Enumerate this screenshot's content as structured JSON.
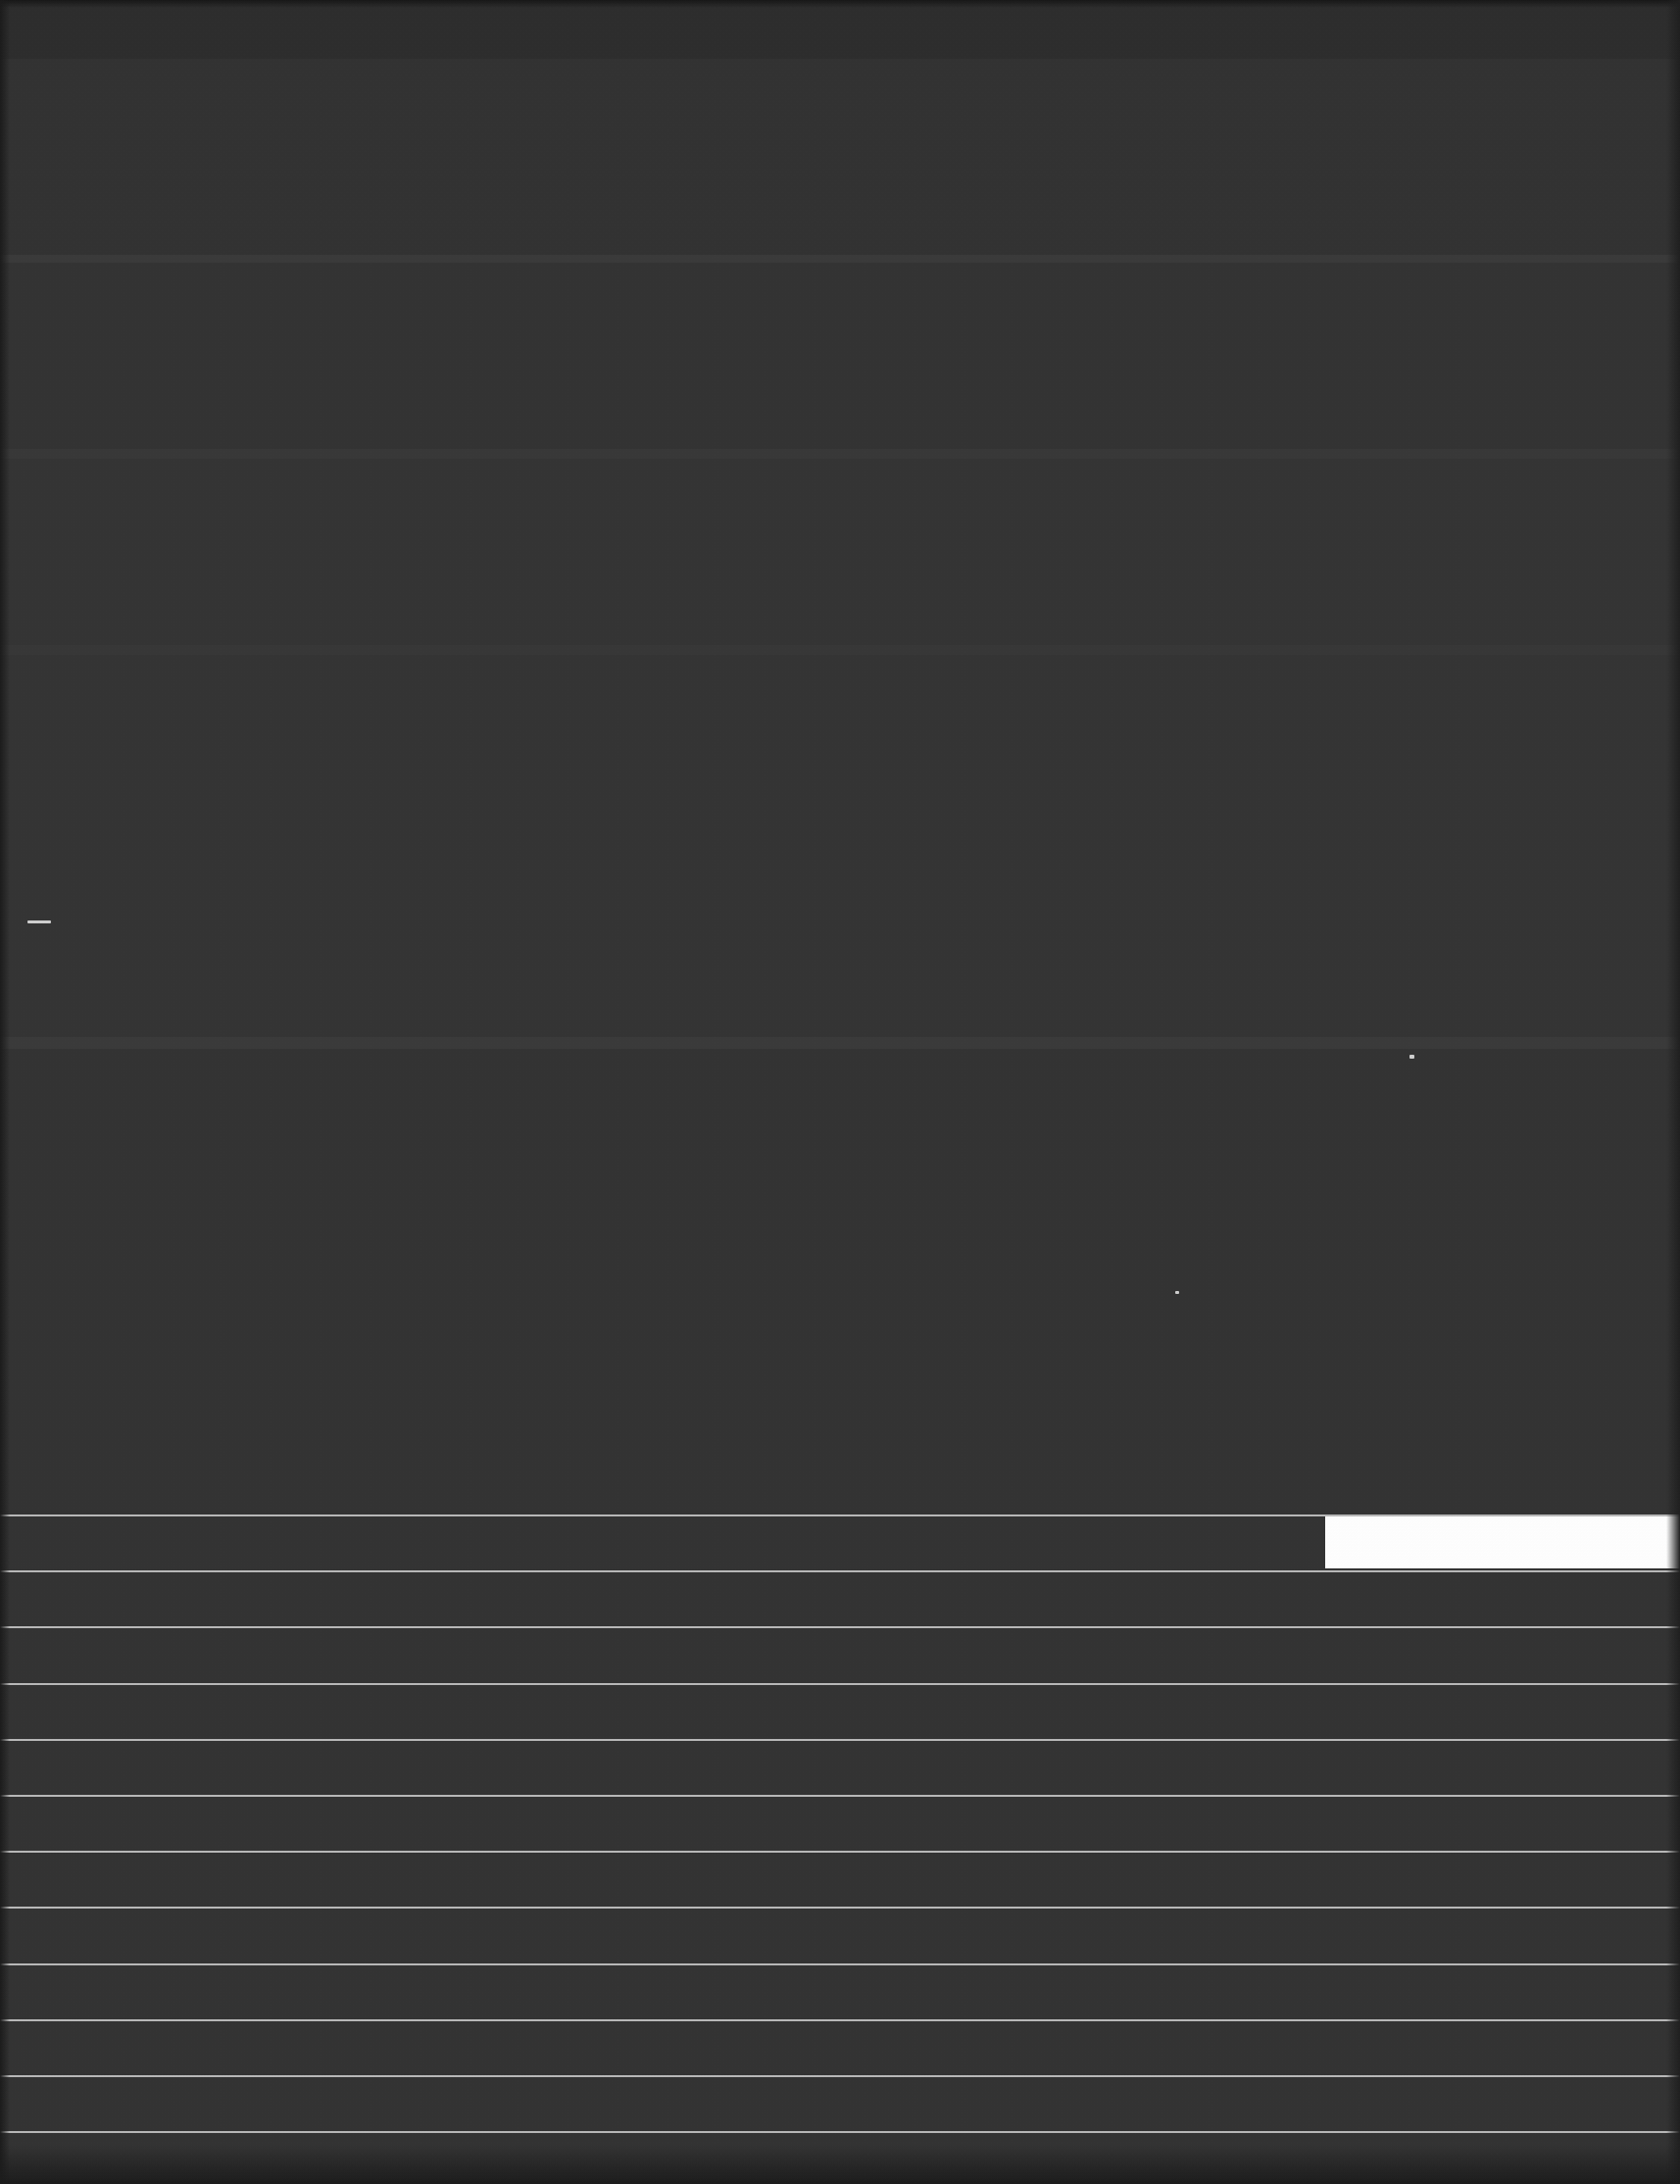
{
  "screen": {
    "width": 1714,
    "height": 2228,
    "background_color": "#333333",
    "appearance": "dark",
    "state_label": "blank-dark-capture"
  },
  "canvas": {
    "name": "empty-content-area",
    "top": 0,
    "height": 1545,
    "background_color": "#333333",
    "bands": [
      {
        "top": 0,
        "height": 60,
        "color": "#2d2d2d"
      },
      {
        "top": 60,
        "height": 200,
        "color": "#323232"
      },
      {
        "top": 260,
        "height": 8,
        "color": "#3a3a3a"
      },
      {
        "top": 268,
        "height": 190,
        "color": "#333333"
      },
      {
        "top": 458,
        "height": 10,
        "color": "#383838"
      },
      {
        "top": 468,
        "height": 190,
        "color": "#343434"
      },
      {
        "top": 658,
        "height": 10,
        "color": "#373737"
      },
      {
        "top": 668,
        "height": 390,
        "color": "#343434"
      },
      {
        "top": 1058,
        "height": 12,
        "color": "#3a3a3a"
      },
      {
        "top": 1070,
        "height": 475,
        "color": "#333333"
      }
    ],
    "specks": [
      {
        "name": "stray-dash-left",
        "x": 28,
        "y": 939,
        "width": 24,
        "height": 3
      },
      {
        "name": "stray-dot-upper",
        "x": 1438,
        "y": 1076,
        "width": 5,
        "height": 4
      },
      {
        "name": "stray-dot-mid",
        "x": 1199,
        "y": 1317,
        "width": 4,
        "height": 3
      }
    ]
  },
  "list": {
    "name": "empty-lined-list",
    "top": 1545,
    "row_height": 57.2,
    "line_color": "#b9b9b9",
    "highlight_color": "#ffffff",
    "row_count": 12,
    "rows": [
      {
        "index": 1,
        "label": "",
        "highlight": {
          "visible": true,
          "left": 1352,
          "right": 1714
        }
      },
      {
        "index": 2,
        "label": "",
        "highlight": {
          "visible": false
        }
      },
      {
        "index": 3,
        "label": "",
        "highlight": {
          "visible": false
        }
      },
      {
        "index": 4,
        "label": "",
        "highlight": {
          "visible": false
        }
      },
      {
        "index": 5,
        "label": "",
        "highlight": {
          "visible": false
        }
      },
      {
        "index": 6,
        "label": "",
        "highlight": {
          "visible": false
        }
      },
      {
        "index": 7,
        "label": "",
        "highlight": {
          "visible": false
        }
      },
      {
        "index": 8,
        "label": "",
        "highlight": {
          "visible": false
        }
      },
      {
        "index": 9,
        "label": "",
        "highlight": {
          "visible": false
        }
      },
      {
        "index": 10,
        "label": "",
        "highlight": {
          "visible": false
        }
      },
      {
        "index": 11,
        "label": "",
        "highlight": {
          "visible": false
        }
      },
      {
        "index": 12,
        "label": "",
        "highlight": {
          "visible": false
        }
      }
    ]
  }
}
